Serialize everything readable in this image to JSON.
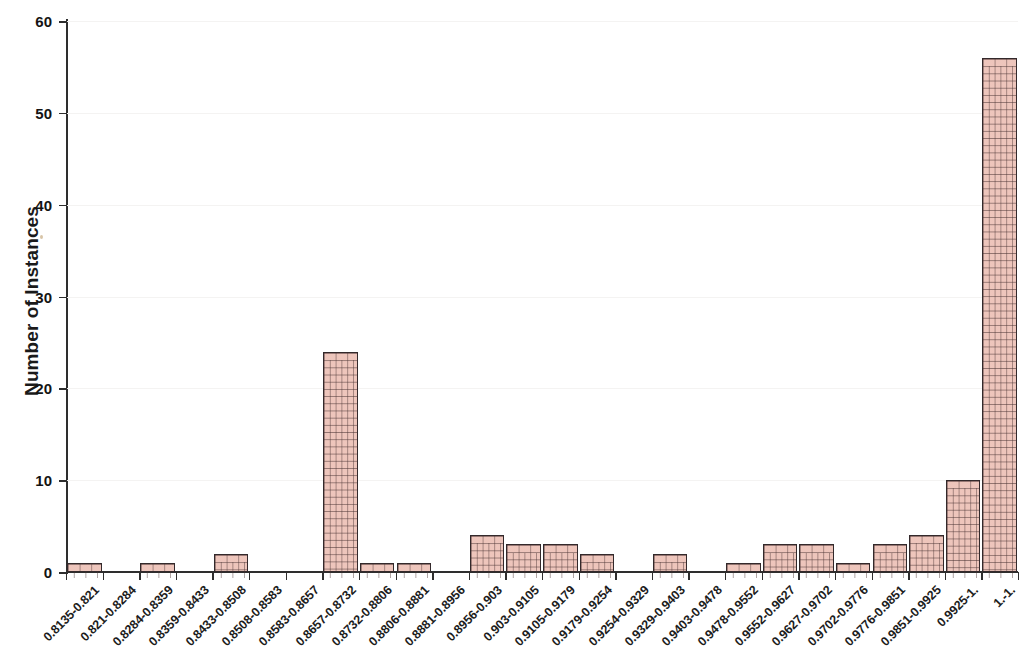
{
  "chart_data": {
    "type": "bar",
    "title": "",
    "subtitle": "",
    "xlabel": "",
    "ylabel": "Number of Instances",
    "ylim": [
      0,
      60
    ],
    "yticks": [
      0,
      10,
      20,
      30,
      40,
      50,
      60
    ],
    "grid": true,
    "legend": null,
    "legend_position": "none",
    "bar_style": {
      "fill": "#e3ab9e",
      "pattern": "brick-hatch",
      "edge": "#33292b"
    },
    "categories": [
      "0.8135-0.821",
      "0.821-0.8284",
      "0.8284-0.8359",
      "0.8359-0.8433",
      "0.8433-0.8508",
      "0.8508-0.8583",
      "0.8583-0.8657",
      "0.8657-0.8732",
      "0.8732-0.8806",
      "0.8806-0.8881",
      "0.8881-0.8956",
      "0.8956-0.903",
      "0.903-0.9105",
      "0.9105-0.9179",
      "0.9179-0.9254",
      "0.9254-0.9329",
      "0.9329-0.9403",
      "0.9403-0.9478",
      "0.9478-0.9552",
      "0.9552-0.9627",
      "0.9627-0.9702",
      "0.9702-0.9776",
      "0.9776-0.9851",
      "0.9851-0.9925",
      "0.9925-1.",
      "1.-1."
    ],
    "values": [
      1,
      0,
      1,
      0,
      2,
      0,
      0,
      24,
      1,
      1,
      0,
      4,
      3,
      3,
      2,
      0,
      2,
      0,
      1,
      3,
      3,
      1,
      3,
      4,
      10,
      56
    ]
  }
}
